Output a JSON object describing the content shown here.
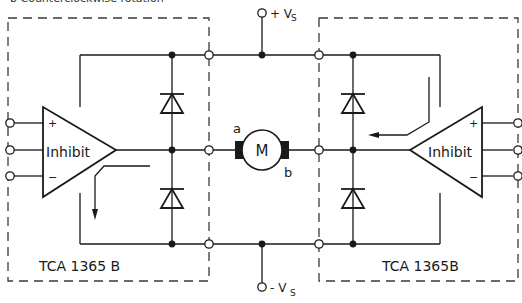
{
  "caption": "b Counterclockwise rotation",
  "supply": {
    "positive_label": "+ V",
    "positive_sub": "S",
    "negative_label": "- V",
    "negative_sub": "S"
  },
  "left_block": {
    "ic_label": "TCA 1365 B",
    "amp_label": "Inhibit",
    "plus": "+",
    "minus": "−"
  },
  "right_block": {
    "ic_label": "TCA 1365B",
    "amp_label": "Inhibit",
    "plus": "+",
    "minus": "−"
  },
  "motor": {
    "label": "M",
    "terminal_a": "a",
    "terminal_b": "b"
  },
  "colors": {
    "line": "#1a1a1a",
    "dashed_box": "#3a3a3a",
    "background": "#ffffff"
  }
}
